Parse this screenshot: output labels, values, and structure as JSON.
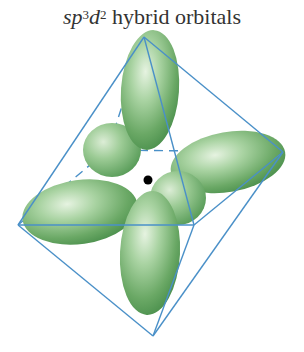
{
  "title": {
    "prefix_italic_sp": "sp",
    "sup_3": "3",
    "italic_d": "d",
    "sup_2": "2",
    "suffix": " hybrid orbitals"
  },
  "diagram": {
    "lobe_count": 6,
    "geometry": "octahedral",
    "colors": {
      "lobe": "#6aa865",
      "lobe_light": "#d8ecd2",
      "lobe_dark": "#3f8a45",
      "edges": "#4a90c8",
      "nucleus": "#000000"
    },
    "vertices": {
      "top": [
        144,
        37
      ],
      "left": [
        18,
        225
      ],
      "right": [
        283,
        152
      ],
      "bottom": [
        153,
        336
      ],
      "front": [
        194,
        225
      ],
      "back": [
        108,
        150
      ]
    }
  }
}
